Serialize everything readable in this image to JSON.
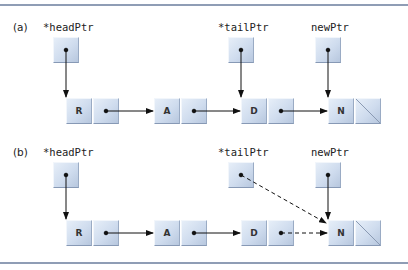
{
  "parts": [
    {
      "label": "(a)",
      "pointers": [
        {
          "name": "*headPtr"
        },
        {
          "name": "*tailPtr"
        },
        {
          "name": "newPtr"
        }
      ],
      "nodes": [
        {
          "data": "R",
          "next": "A"
        },
        {
          "data": "A",
          "next": "D"
        },
        {
          "data": "D",
          "next": "N"
        },
        {
          "data": "N",
          "next": "NULL"
        }
      ]
    },
    {
      "label": "(b)",
      "pointers": [
        {
          "name": "*headPtr"
        },
        {
          "name": "*tailPtr"
        },
        {
          "name": "newPtr"
        }
      ],
      "nodes": [
        {
          "data": "R",
          "next": "A"
        },
        {
          "data": "A",
          "next": "D"
        },
        {
          "data": "D",
          "next": "N"
        },
        {
          "data": "N",
          "next": "NULL"
        }
      ],
      "dashed_links": [
        "tailPtr -> N",
        "D.next -> N"
      ]
    }
  ],
  "colors": {
    "node_fill": "#cfdcee",
    "rule": "#8f9db5",
    "arrow": "#111111"
  }
}
